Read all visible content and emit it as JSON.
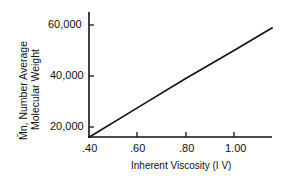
{
  "chart_data": {
    "type": "line",
    "title": "",
    "xlabel": "Inherent Viscosity (I V)",
    "ylabel_line1": "M̄n, Number Average",
    "ylabel_line2": "Molecular Weight",
    "xlim": [
      0.4,
      1.16
    ],
    "ylim": [
      15000,
      62000
    ],
    "x_ticks": [
      ".40",
      ".60",
      ".80",
      "1.00"
    ],
    "y_ticks": [
      "20,000",
      "40,000",
      "60,000"
    ],
    "grid": false,
    "legend": null,
    "series": [
      {
        "name": "Mn vs IV",
        "x": [
          0.4,
          0.6,
          0.8,
          1.0,
          1.16
        ],
        "y": [
          16000,
          27500,
          39000,
          50000,
          59000
        ]
      }
    ]
  }
}
